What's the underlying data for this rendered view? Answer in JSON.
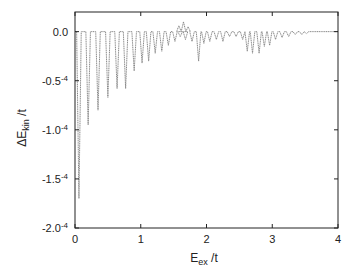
{
  "chart_data": {
    "type": "line",
    "title": "",
    "xlabel": "E_ex /t",
    "ylabel": "ΔE_kin /t",
    "xlim": [
      0,
      4
    ],
    "ylim": [
      -0.0002,
      2e-05
    ],
    "grid": false,
    "legend": null,
    "x_ticks": [
      0,
      1,
      2,
      3,
      4
    ],
    "x_tick_labels": [
      "0",
      "1",
      "2",
      "3",
      "4"
    ],
    "y_ticks": [
      0.0,
      -5e-05,
      -0.0001,
      -0.00015,
      -0.0002
    ],
    "y_tick_labels": [
      {
        "base": "0.0",
        "exp": ""
      },
      {
        "base": "-0.5",
        "exp": "-4"
      },
      {
        "base": "-1.0",
        "exp": "-4"
      },
      {
        "base": "-1.5",
        "exp": "-4"
      },
      {
        "base": "-2.0",
        "exp": "-4"
      }
    ],
    "series": [
      {
        "name": "ΔE_kin",
        "color": "#888888",
        "style": "dotted",
        "dips": [
          [
            0.06,
            -1.7
          ],
          [
            0.2,
            -0.95
          ],
          [
            0.35,
            -0.8
          ],
          [
            0.5,
            -0.67
          ],
          [
            0.64,
            -0.58
          ],
          [
            0.77,
            -0.58
          ],
          [
            0.9,
            -0.4
          ],
          [
            1.02,
            -0.32
          ],
          [
            1.12,
            -0.3
          ],
          [
            1.22,
            -0.22
          ],
          [
            1.32,
            -0.2
          ],
          [
            1.42,
            -0.14
          ],
          [
            1.52,
            -0.1
          ],
          [
            1.6,
            -0.05
          ],
          [
            1.68,
            -0.08
          ],
          [
            1.78,
            -0.1
          ],
          [
            1.88,
            -0.3
          ],
          [
            1.96,
            -0.12
          ],
          [
            2.05,
            -0.1
          ],
          [
            2.15,
            -0.08
          ],
          [
            2.25,
            -0.1
          ],
          [
            2.35,
            -0.05
          ],
          [
            2.45,
            -0.05
          ],
          [
            2.55,
            -0.08
          ],
          [
            2.62,
            -0.2
          ],
          [
            2.7,
            -0.22
          ],
          [
            2.8,
            -0.22
          ],
          [
            2.88,
            -0.15
          ],
          [
            2.96,
            -0.14
          ],
          [
            3.05,
            -0.08
          ],
          [
            3.15,
            -0.06
          ],
          [
            3.25,
            -0.05
          ],
          [
            3.35,
            -0.03
          ],
          [
            3.45,
            -0.03
          ],
          [
            3.52,
            -0.02
          ]
        ],
        "peaks": [
          [
            1.65,
            0.1
          ],
          [
            1.58,
            0.06
          ],
          [
            1.72,
            0.05
          ]
        ],
        "scale": 0.0001
      }
    ]
  }
}
